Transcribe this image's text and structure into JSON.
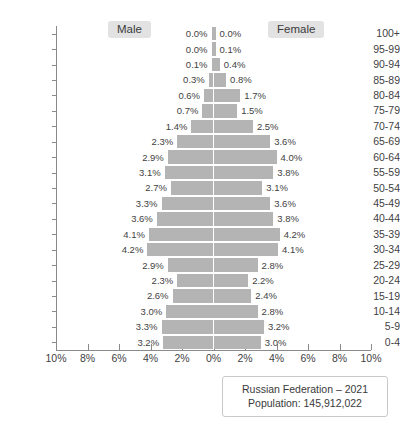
{
  "legend": {
    "male_label": "Male",
    "female_label": "Female"
  },
  "caption": {
    "line1": "Russian Federation – 2021",
    "line2": "Population: 145,912,022"
  },
  "axis": {
    "x_tick_labels": [
      "10%",
      "8%",
      "6%",
      "4%",
      "2%",
      "0%",
      "2%",
      "4%",
      "6%",
      "8%",
      "10%"
    ],
    "x_tick_values": [
      -10,
      -8,
      -6,
      -4,
      -2,
      0,
      2,
      4,
      6,
      8,
      10
    ],
    "xlim": [
      -10,
      10
    ]
  },
  "chart_data": {
    "type": "bar",
    "subtype": "population-pyramid",
    "title": "Russian Federation – 2021",
    "subtitle": "Population: 145,912,022",
    "xlabel": "",
    "ylabel": "",
    "xlim": [
      -10,
      10
    ],
    "grid": false,
    "legend_position": "top",
    "categories": [
      "100+",
      "95-99",
      "90-94",
      "85-89",
      "80-84",
      "75-79",
      "70-74",
      "65-69",
      "60-64",
      "55-59",
      "50-54",
      "45-49",
      "40-44",
      "35-39",
      "30-34",
      "25-29",
      "20-24",
      "15-19",
      "10-14",
      "5-9",
      "0-4"
    ],
    "series": [
      {
        "name": "Male",
        "side": "left",
        "color": "#b4b4b4",
        "values": [
          0.0,
          0.0,
          0.1,
          0.3,
          0.6,
          0.7,
          1.4,
          2.3,
          2.9,
          3.1,
          2.7,
          3.3,
          3.6,
          4.1,
          4.2,
          2.9,
          2.3,
          2.6,
          3.0,
          3.3,
          3.2
        ],
        "labels": [
          "0.0%",
          "0.0%",
          "0.1%",
          "0.3%",
          "0.6%",
          "0.7%",
          "1.4%",
          "2.3%",
          "2.9%",
          "3.1%",
          "2.7%",
          "3.3%",
          "3.6%",
          "4.1%",
          "4.2%",
          "2.9%",
          "2.3%",
          "2.6%",
          "3.0%",
          "3.3%",
          "3.2%"
        ]
      },
      {
        "name": "Female",
        "side": "right",
        "color": "#b4b4b4",
        "values": [
          0.0,
          0.1,
          0.4,
          0.8,
          1.7,
          1.5,
          2.5,
          3.6,
          4.0,
          3.8,
          3.1,
          3.6,
          3.8,
          4.2,
          4.1,
          2.8,
          2.2,
          2.4,
          2.8,
          3.2,
          3.0
        ],
        "labels": [
          "0.0%",
          "0.1%",
          "0.4%",
          "0.8%",
          "1.7%",
          "1.5%",
          "2.5%",
          "3.6%",
          "4.0%",
          "3.8%",
          "3.1%",
          "3.6%",
          "3.8%",
          "4.2%",
          "4.1%",
          "2.8%",
          "2.2%",
          "2.4%",
          "2.8%",
          "3.2%",
          "3.0%"
        ]
      }
    ]
  }
}
